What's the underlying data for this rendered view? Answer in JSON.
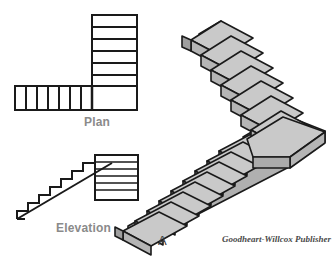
{
  "figure": {
    "width": 332,
    "height": 274,
    "background": "#ffffff",
    "caption_letter": "A",
    "credit": "Goodheart-Willcox Publisher"
  },
  "labels": {
    "plan": "Plan",
    "elevation": "Elevation",
    "label_color": "#8a8a8a"
  },
  "colors": {
    "line": "#1a1a1a",
    "tread_top": "#c9c9c9",
    "riser_face": "#b5b5b5",
    "side_face": "#9f9f9f",
    "white_fill": "#ffffff"
  },
  "plan_view": {
    "title": "Plan",
    "upper_run_steps": 7,
    "lower_run_steps": 7,
    "landing_present": true,
    "description": "L-shaped stair plan: vertical run of 7 treads at upper right meeting a square landing, with a horizontal run of 7 treads extending to the left"
  },
  "elevation_view": {
    "title": "Elevation",
    "steps": 7,
    "landing_lines": 6,
    "description": "Side elevation showing stair rising left to right to a landing block of stacked treads"
  },
  "isometric_view": {
    "upper_flight_steps": 8,
    "lower_flight_steps": 9,
    "landing_present": true,
    "description": "Isometric pictorial of an L-shaped switchback stair with intermediate landing"
  }
}
